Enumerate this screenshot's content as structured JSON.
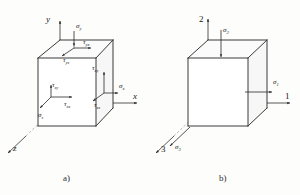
{
  "figure": {
    "panels": [
      {
        "id": "a",
        "caption": "a)",
        "type": "general-stress-element",
        "axes": [
          {
            "name": "y-axis",
            "label": "y",
            "direction": "up"
          },
          {
            "name": "x-axis",
            "label": "x",
            "direction": "right"
          },
          {
            "name": "z-axis",
            "label": "z",
            "direction": "down-left"
          }
        ],
        "stress_labels": [
          {
            "name": "sigma-y",
            "symbol": "σ",
            "sub": "y"
          },
          {
            "name": "tau-yx",
            "symbol": "τ",
            "sub": "yx"
          },
          {
            "name": "tau-yz",
            "symbol": "τ",
            "sub": "yz"
          },
          {
            "name": "tau-xy",
            "symbol": "τ",
            "sub": "xy"
          },
          {
            "name": "sigma-x",
            "symbol": "σ",
            "sub": "x"
          },
          {
            "name": "tau-xz",
            "symbol": "τ",
            "sub": "xz"
          },
          {
            "name": "tau-zy",
            "symbol": "τ",
            "sub": "zy"
          },
          {
            "name": "tau-zx",
            "symbol": "τ",
            "sub": "zx"
          },
          {
            "name": "sigma-z",
            "symbol": "σ",
            "sub": "z"
          }
        ]
      },
      {
        "id": "b",
        "caption": "b)",
        "type": "principal-stress-element",
        "axes": [
          {
            "name": "axis-2",
            "label": "2",
            "direction": "up"
          },
          {
            "name": "axis-1",
            "label": "1",
            "direction": "right"
          },
          {
            "name": "axis-3",
            "label": "3",
            "direction": "down-left"
          }
        ],
        "stress_labels": [
          {
            "name": "sigma-2",
            "symbol": "σ",
            "sub": "2"
          },
          {
            "name": "sigma-1",
            "symbol": "σ",
            "sub": "1"
          },
          {
            "name": "sigma-3",
            "symbol": "σ",
            "sub": "3"
          }
        ]
      }
    ],
    "colors": {
      "line": "#3a3a3a",
      "hidden": "#9a9a9a",
      "text": "#1a1a1a",
      "background": "#fdfdfb"
    }
  }
}
